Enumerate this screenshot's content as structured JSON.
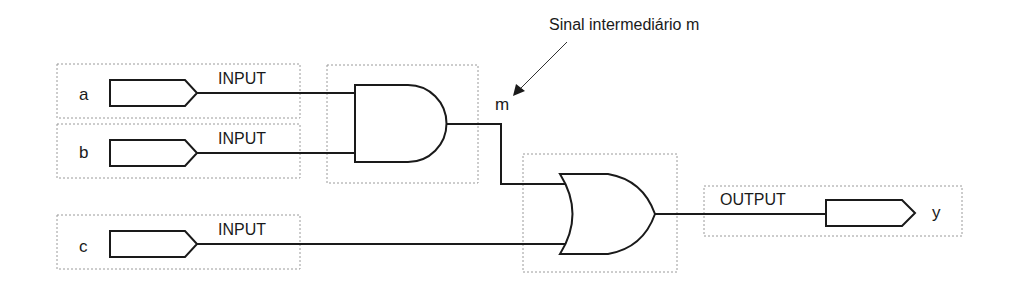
{
  "diagram": {
    "annotation": "Sinal intermediário m",
    "intermediate_signal": "m",
    "inputs": [
      {
        "name": "a",
        "type_label": "INPUT"
      },
      {
        "name": "b",
        "type_label": "INPUT"
      },
      {
        "name": "c",
        "type_label": "INPUT"
      }
    ],
    "output": {
      "name": "y",
      "type_label": "OUTPUT"
    },
    "gates": [
      {
        "type": "AND",
        "inputs": [
          "a",
          "b"
        ],
        "output": "m"
      },
      {
        "type": "OR",
        "inputs": [
          "m",
          "c"
        ],
        "output": "y"
      }
    ],
    "colors": {
      "line": "#1a1a1a",
      "box_border": "#9a9a9a"
    }
  }
}
